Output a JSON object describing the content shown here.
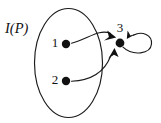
{
  "figure": {
    "kind": "directed-graph-diagram",
    "set_label": "I(P)",
    "nodes": [
      {
        "id": "1",
        "label": "1",
        "cx": 66,
        "cy": 44,
        "r": 4.2,
        "label_x": 55,
        "label_y": 44,
        "inside_set": true
      },
      {
        "id": "2",
        "label": "2",
        "cx": 66,
        "cy": 81,
        "r": 4.2,
        "label_x": 55,
        "label_y": 81,
        "inside_set": true
      },
      {
        "id": "3",
        "label": "3",
        "cx": 120,
        "cy": 43,
        "r": 4.4,
        "label_x": 120,
        "label_y": 30,
        "inside_set": false
      }
    ],
    "edges": [
      {
        "from": "1",
        "to": "3",
        "kind": "curve"
      },
      {
        "from": "2",
        "to": "3",
        "kind": "curve"
      },
      {
        "from": "3",
        "to": "3",
        "kind": "self-loop"
      }
    ],
    "set_region": {
      "shape": "ellipse",
      "cx": 68.5,
      "cy": 63,
      "rx": 34,
      "ry": 54.5,
      "label_x": 5,
      "label_y": 29
    },
    "colors": {
      "ink": "#111111",
      "stroke": "#1a1a1a",
      "background": "#ffffff"
    }
  }
}
